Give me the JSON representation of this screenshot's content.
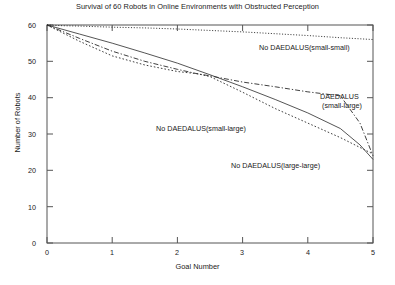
{
  "chart_data": {
    "type": "line",
    "title": "Survival of 60 Robots in Online Environments with Obstructed Perception",
    "xlabel": "Goal Number",
    "ylabel": "Number of Robots",
    "xlim": [
      0,
      5
    ],
    "ylim": [
      0,
      60
    ],
    "xticks": [
      "0",
      "1",
      "2",
      "3",
      "4",
      "5"
    ],
    "yticks": [
      "0",
      "10",
      "20",
      "30",
      "40",
      "50",
      "60"
    ],
    "grid": false,
    "legend_position": "inline-annotations",
    "series": [
      {
        "name": "No DAEDALUS(small-small)",
        "style": "fine-dotted",
        "x": [
          0,
          0.25,
          0.5,
          1,
          1.5,
          2,
          2.5,
          3,
          3.5,
          4,
          4.5,
          5
        ],
        "values": [
          60,
          59.8,
          59.7,
          59.4,
          59.2,
          58.9,
          58.5,
          58.1,
          57.6,
          57.1,
          56.5,
          56.0
        ]
      },
      {
        "name": "DAEDALUS(small-large)",
        "style": "solid",
        "x": [
          0,
          0.5,
          1,
          1.5,
          2,
          2.5,
          3,
          3.5,
          4,
          4.5,
          4.8,
          5
        ],
        "values": [
          60,
          57.5,
          55.0,
          52.3,
          49.5,
          46.3,
          43.0,
          39.5,
          35.8,
          31.5,
          27.0,
          23.0
        ]
      },
      {
        "name": "No DAEDALUS(small-large)",
        "style": "dash-dot",
        "x": [
          0,
          0.5,
          1,
          1.5,
          2,
          2.3,
          2.5,
          3,
          3.5,
          4,
          4.5,
          4.8,
          5
        ],
        "values": [
          60,
          56.3,
          52.8,
          50.0,
          47.8,
          46.6,
          46.0,
          44.3,
          43.0,
          41.6,
          40.5,
          33.0,
          24.0
        ]
      },
      {
        "name": "No DAEDALUS(large-large)",
        "style": "dotted",
        "x": [
          0,
          0.5,
          1,
          1.5,
          2,
          2.3,
          2.5,
          3,
          3.5,
          4,
          4.5,
          5
        ],
        "values": [
          60,
          55.5,
          51.5,
          49.0,
          47.2,
          46.6,
          45.8,
          41.5,
          37.0,
          33.0,
          29.0,
          24.5
        ]
      }
    ],
    "annotations": [
      {
        "id": "ann-no-daedalus-small-small",
        "text": "No DAEDALUS(small-small)",
        "x_px": 259,
        "y_px": 47
      },
      {
        "id": "ann-daedalus-small-large-line1",
        "text": "DAEDALUS",
        "x_px": 320,
        "y_px": 96
      },
      {
        "id": "ann-daedalus-small-large-line2",
        "text": "(small-large)",
        "x_px": 322,
        "y_px": 105
      },
      {
        "id": "ann-no-daedalus-small-large",
        "text": "No DAEDALUS(small-large)",
        "x_px": 156,
        "y_px": 128
      },
      {
        "id": "ann-no-daedalus-large-large",
        "text": "No DAEDALUS(large-large)",
        "x_px": 231,
        "y_px": 165
      }
    ]
  }
}
